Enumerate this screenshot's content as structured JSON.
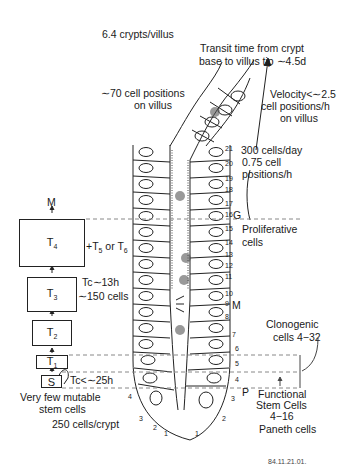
{
  "title_labels": {
    "crypts_per_villus": "6.4 crypts/villus",
    "transit_time_line1": "Transit time from crypt",
    "transit_time_line2": "base to villus tip ∼4.5d",
    "villus_positions_line1": "∼70 cell positions",
    "villus_positions_line2": "on villus",
    "velocity_line1": "Velocity<∼2.5",
    "velocity_line2": "cell positions/h",
    "velocity_line3": "on villus",
    "output_line1": "300 cells/day",
    "output_line2": "0.75 cell",
    "output_line3": "positions/h"
  },
  "hierarchy": {
    "top_label": "M",
    "boxes": [
      {
        "id": "T4",
        "main": "T",
        "sub": "4"
      },
      {
        "id": "T3",
        "main": "T",
        "sub": "3"
      },
      {
        "id": "T2",
        "main": "T",
        "sub": "2"
      },
      {
        "id": "T1",
        "main": "T",
        "sub": "1"
      },
      {
        "id": "S",
        "main": "S",
        "sub": ""
      }
    ],
    "t4_extra": {
      "prefix": "+T",
      "sub1": "5",
      "mid": " or T",
      "sub2": "6"
    },
    "t3_cycle": "Tc∼13h",
    "t3_cells": "∼150 cells",
    "s_cycle": "Tc<∼25h",
    "stem_note_line1": "Very few mutable",
    "stem_note_line2": "stem cells",
    "cells_per_crypt": "250 cells/crypt"
  },
  "crypt_annotations": {
    "G": "G",
    "proliferative_line1": "Proliferative",
    "proliferative_line2": "cells",
    "M": "M",
    "P": "P",
    "clonogenic_line1": "Clonogenic",
    "clonogenic_line2": "cells 4−32",
    "functional_line1": "Functional",
    "functional_line2": "Stem Cells",
    "functional_line3": "4−16",
    "paneth": "Paneth cells"
  },
  "cell_positions_right": [
    "21",
    "20",
    "19",
    "18",
    "17",
    "16",
    "15",
    "14",
    "13",
    "12",
    "11",
    "10",
    "9",
    "8",
    "7",
    "6",
    "5",
    "4",
    "3",
    "2",
    "1"
  ],
  "cell_positions_left": [
    "4",
    "3",
    "2",
    "1"
  ],
  "figure_id": "84.11.21.01."
}
